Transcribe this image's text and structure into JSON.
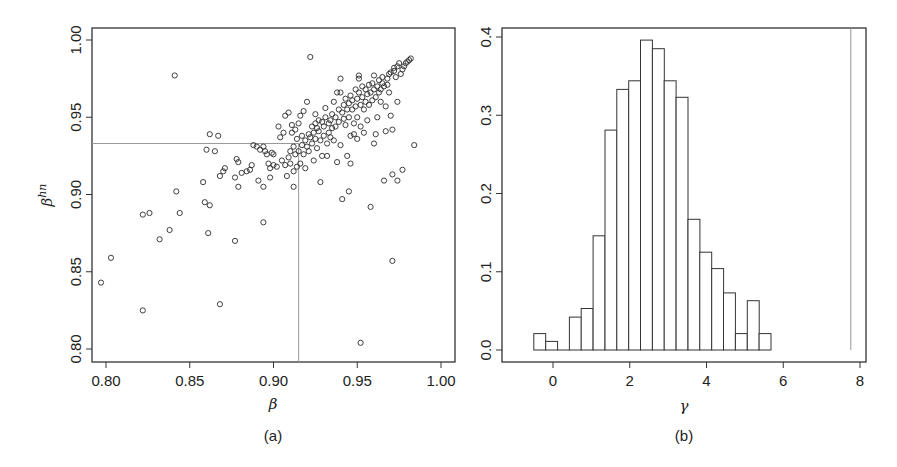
{
  "chart_data": [
    {
      "panel": "(a)",
      "type": "scatter",
      "title": "",
      "xlabel": "β",
      "ylabel": "β^hn",
      "ylabel_base": "β",
      "ylabel_sup": "hn",
      "xlim": [
        0.79,
        1.008
      ],
      "ylim": [
        0.792,
        1.008
      ],
      "xticks": [
        0.8,
        0.85,
        0.9,
        0.95,
        1.0
      ],
      "xtick_labels": [
        "0.80",
        "0.85",
        "0.90",
        "0.95",
        "1.00"
      ],
      "yticks": [
        0.8,
        0.85,
        0.9,
        0.95,
        1.0
      ],
      "ytick_labels": [
        "0.80",
        "0.85",
        "0.90",
        "0.95",
        "1.00"
      ],
      "grid": false,
      "reference_lines": {
        "x": 0.915,
        "y": 0.933
      },
      "points": [
        [
          0.797,
          0.843
        ],
        [
          0.803,
          0.859
        ],
        [
          0.822,
          0.825
        ],
        [
          0.822,
          0.887
        ],
        [
          0.826,
          0.888
        ],
        [
          0.832,
          0.871
        ],
        [
          0.838,
          0.877
        ],
        [
          0.841,
          0.977
        ],
        [
          0.842,
          0.902
        ],
        [
          0.844,
          0.888
        ],
        [
          0.858,
          0.908
        ],
        [
          0.859,
          0.895
        ],
        [
          0.86,
          0.929
        ],
        [
          0.861,
          0.875
        ],
        [
          0.862,
          0.939
        ],
        [
          0.862,
          0.893
        ],
        [
          0.865,
          0.928
        ],
        [
          0.867,
          0.938
        ],
        [
          0.868,
          0.829
        ],
        [
          0.868,
          0.912
        ],
        [
          0.87,
          0.915
        ],
        [
          0.871,
          0.917
        ],
        [
          0.877,
          0.87
        ],
        [
          0.877,
          0.911
        ],
        [
          0.878,
          0.923
        ],
        [
          0.879,
          0.905
        ],
        [
          0.879,
          0.921
        ],
        [
          0.881,
          0.914
        ],
        [
          0.884,
          0.915
        ],
        [
          0.886,
          0.916
        ],
        [
          0.887,
          0.919
        ],
        [
          0.888,
          0.932
        ],
        [
          0.89,
          0.931
        ],
        [
          0.891,
          0.909
        ],
        [
          0.892,
          0.929
        ],
        [
          0.894,
          0.882
        ],
        [
          0.894,
          0.905
        ],
        [
          0.894,
          0.931
        ],
        [
          0.895,
          0.928
        ],
        [
          0.896,
          0.926
        ],
        [
          0.897,
          0.92
        ],
        [
          0.898,
          0.917
        ],
        [
          0.898,
          0.911
        ],
        [
          0.899,
          0.927
        ],
        [
          0.9,
          0.919
        ],
        [
          0.9,
          0.926
        ],
        [
          0.902,
          0.918
        ],
        [
          0.903,
          0.944
        ],
        [
          0.904,
          0.937
        ],
        [
          0.905,
          0.922
        ],
        [
          0.906,
          0.94
        ],
        [
          0.907,
          0.919
        ],
        [
          0.907,
          0.951
        ],
        [
          0.908,
          0.912
        ],
        [
          0.909,
          0.924
        ],
        [
          0.909,
          0.953
        ],
        [
          0.91,
          0.92
        ],
        [
          0.91,
          0.928
        ],
        [
          0.911,
          0.94
        ],
        [
          0.911,
          0.945
        ],
        [
          0.912,
          0.915
        ],
        [
          0.912,
          0.905
        ],
        [
          0.912,
          0.931
        ],
        [
          0.913,
          0.926
        ],
        [
          0.913,
          0.942
        ],
        [
          0.914,
          0.918
        ],
        [
          0.914,
          0.936
        ],
        [
          0.915,
          0.928
        ],
        [
          0.915,
          0.946
        ],
        [
          0.916,
          0.92
        ],
        [
          0.916,
          0.951
        ],
        [
          0.917,
          0.938
        ],
        [
          0.917,
          0.932
        ],
        [
          0.918,
          0.954
        ],
        [
          0.918,
          0.926
        ],
        [
          0.919,
          0.935
        ],
        [
          0.919,
          0.917
        ],
        [
          0.92,
          0.931
        ],
        [
          0.92,
          0.96
        ],
        [
          0.921,
          0.939
        ],
        [
          0.921,
          0.928
        ],
        [
          0.922,
          0.937
        ],
        [
          0.922,
          0.989
        ],
        [
          0.923,
          0.944
        ],
        [
          0.923,
          0.933
        ],
        [
          0.924,
          0.94
        ],
        [
          0.924,
          0.922
        ],
        [
          0.925,
          0.946
        ],
        [
          0.925,
          0.936
        ],
        [
          0.925,
          0.952
        ],
        [
          0.926,
          0.943
        ],
        [
          0.926,
          0.93
        ],
        [
          0.927,
          0.948
        ],
        [
          0.927,
          0.941
        ],
        [
          0.928,
          0.935
        ],
        [
          0.928,
          0.908
        ],
        [
          0.929,
          0.947
        ],
        [
          0.929,
          0.925
        ],
        [
          0.93,
          0.944
        ],
        [
          0.93,
          0.938
        ],
        [
          0.931,
          0.956
        ],
        [
          0.931,
          0.95
        ],
        [
          0.932,
          0.933
        ],
        [
          0.932,
          0.925
        ],
        [
          0.933,
          0.946
        ],
        [
          0.933,
          0.94
        ],
        [
          0.934,
          0.948
        ],
        [
          0.934,
          0.937
        ],
        [
          0.935,
          0.952
        ],
        [
          0.935,
          0.943
        ],
        [
          0.936,
          0.96
        ],
        [
          0.936,
          0.935
        ],
        [
          0.937,
          0.95
        ],
        [
          0.937,
          0.944
        ],
        [
          0.938,
          0.966
        ],
        [
          0.938,
          0.921
        ],
        [
          0.939,
          0.955
        ],
        [
          0.939,
          0.947
        ],
        [
          0.94,
          0.975
        ],
        [
          0.94,
          0.966
        ],
        [
          0.94,
          0.932
        ],
        [
          0.941,
          0.953
        ],
        [
          0.941,
          0.897
        ],
        [
          0.942,
          0.958
        ],
        [
          0.942,
          0.949
        ],
        [
          0.943,
          0.962
        ],
        [
          0.943,
          0.945
        ],
        [
          0.944,
          0.955
        ],
        [
          0.944,
          0.925
        ],
        [
          0.945,
          0.959
        ],
        [
          0.945,
          0.95
        ],
        [
          0.945,
          0.902
        ],
        [
          0.946,
          0.964
        ],
        [
          0.946,
          0.938
        ],
        [
          0.946,
          0.92
        ],
        [
          0.947,
          0.955
        ],
        [
          0.947,
          0.961
        ],
        [
          0.948,
          0.946
        ],
        [
          0.948,
          0.939
        ],
        [
          0.949,
          0.968
        ],
        [
          0.949,
          0.957
        ],
        [
          0.95,
          0.962
        ],
        [
          0.95,
          0.95
        ],
        [
          0.95,
          0.936
        ],
        [
          0.951,
          0.966
        ],
        [
          0.951,
          0.975
        ],
        [
          0.951,
          0.977
        ],
        [
          0.952,
          0.958
        ],
        [
          0.952,
          0.944
        ],
        [
          0.952,
          0.804
        ],
        [
          0.953,
          0.963
        ],
        [
          0.953,
          0.97
        ],
        [
          0.954,
          0.955
        ],
        [
          0.954,
          0.94
        ],
        [
          0.955,
          0.968
        ],
        [
          0.955,
          0.96
        ],
        [
          0.956,
          0.965
        ],
        [
          0.956,
          0.948
        ],
        [
          0.957,
          0.971
        ],
        [
          0.957,
          0.958
        ],
        [
          0.958,
          0.892
        ],
        [
          0.958,
          0.966
        ],
        [
          0.959,
          0.972
        ],
        [
          0.959,
          0.961
        ],
        [
          0.96,
          0.977
        ],
        [
          0.96,
          0.968
        ],
        [
          0.96,
          0.933
        ],
        [
          0.961,
          0.963
        ],
        [
          0.961,
          0.939
        ],
        [
          0.962,
          0.97
        ],
        [
          0.962,
          0.95
        ],
        [
          0.963,
          0.974
        ],
        [
          0.963,
          0.966
        ],
        [
          0.964,
          0.968
        ],
        [
          0.964,
          0.96
        ],
        [
          0.965,
          0.972
        ],
        [
          0.965,
          0.976
        ],
        [
          0.966,
          0.97
        ],
        [
          0.966,
          0.909
        ],
        [
          0.967,
          0.957
        ],
        [
          0.967,
          0.941
        ],
        [
          0.968,
          0.975
        ],
        [
          0.968,
          0.971
        ],
        [
          0.969,
          0.978
        ],
        [
          0.969,
          0.966
        ],
        [
          0.97,
          0.951
        ],
        [
          0.97,
          0.979
        ],
        [
          0.971,
          0.913
        ],
        [
          0.971,
          0.857
        ],
        [
          0.971,
          0.942
        ],
        [
          0.972,
          0.98
        ],
        [
          0.972,
          0.982
        ],
        [
          0.973,
          0.976
        ],
        [
          0.974,
          0.96
        ],
        [
          0.974,
          0.909
        ],
        [
          0.974,
          0.983
        ],
        [
          0.975,
          0.985
        ],
        [
          0.976,
          0.978
        ],
        [
          0.977,
          0.981
        ],
        [
          0.977,
          0.916
        ],
        [
          0.978,
          0.983
        ],
        [
          0.979,
          0.985
        ],
        [
          0.98,
          0.986
        ],
        [
          0.981,
          0.987
        ],
        [
          0.982,
          0.988
        ],
        [
          0.984,
          0.932
        ]
      ]
    },
    {
      "panel": "(b)",
      "type": "bar",
      "subtype": "histogram",
      "title": "",
      "xlabel": "γ",
      "ylabel": "",
      "xlim": [
        -1.35,
        8.15
      ],
      "ylim": [
        -0.016,
        0.41
      ],
      "xticks": [
        0,
        2,
        4,
        6,
        8
      ],
      "xtick_labels": [
        "0",
        "2",
        "4",
        "6",
        "8"
      ],
      "yticks": [
        0.0,
        0.1,
        0.2,
        0.3,
        0.4
      ],
      "ytick_labels": [
        "0.0",
        "0.1",
        "0.2",
        "0.3",
        "0.4"
      ],
      "grid": false,
      "bin_start": -0.5,
      "bin_width": 0.309,
      "categories": [
        "-0.50",
        "-0.19",
        "0.12",
        "0.43",
        "0.74",
        "1.05",
        "1.35",
        "1.66",
        "1.97",
        "2.28",
        "2.59",
        "2.90",
        "3.21",
        "3.52",
        "3.83",
        "4.14",
        "4.44",
        "4.75",
        "5.06",
        "5.37"
      ],
      "values": [
        0.021,
        0.011,
        0.0,
        0.042,
        0.053,
        0.146,
        0.281,
        0.333,
        0.344,
        0.396,
        0.385,
        0.344,
        0.323,
        0.167,
        0.125,
        0.104,
        0.073,
        0.021,
        0.063,
        0.021
      ],
      "reference_line_x": 7.76
    }
  ],
  "panels": {
    "a": {
      "label": "(a)",
      "xlabel": "β",
      "ylabel_base": "β",
      "ylabel_sup": "hn"
    },
    "b": {
      "label": "(b)",
      "xlabel": "γ"
    }
  },
  "colors": {
    "axis": "#333333",
    "marker": "#2b2b2b",
    "bar_edge": "#333333",
    "bar_fill": "#ffffff",
    "reference_line": "#9a9a9a"
  }
}
